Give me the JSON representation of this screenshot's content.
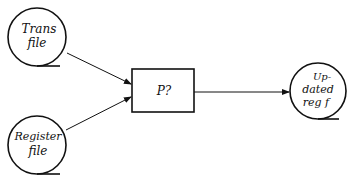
{
  "diagram": {
    "type": "data-flow",
    "nodes": [
      {
        "id": "trans",
        "shape": "file-circle",
        "label_lines": [
          "Trans",
          "file"
        ]
      },
      {
        "id": "register",
        "shape": "file-circle",
        "label_lines": [
          "Register",
          "file"
        ]
      },
      {
        "id": "process",
        "shape": "box",
        "label": "P?"
      },
      {
        "id": "updated",
        "shape": "file-circle",
        "label_lines": [
          "Up-",
          "dated",
          "reg f"
        ]
      }
    ],
    "edges": [
      {
        "from": "trans",
        "to": "process"
      },
      {
        "from": "register",
        "to": "process"
      },
      {
        "from": "process",
        "to": "updated"
      }
    ],
    "colors": {
      "stroke": "#111111",
      "background": "#ffffff"
    }
  }
}
